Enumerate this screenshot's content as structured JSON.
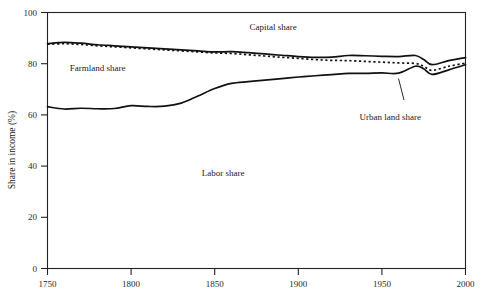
{
  "chart_data": {
    "type": "line",
    "title": "",
    "xlabel": "",
    "ylabel": "Share in income (%)",
    "xlim": [
      1750,
      2000
    ],
    "ylim": [
      0,
      100
    ],
    "xticks": [
      1750,
      1800,
      1850,
      1900,
      1950,
      2000
    ],
    "xtick_labels": [
      "1750",
      "1800",
      "1850",
      "1900",
      "1950",
      "2000"
    ],
    "yticks": [
      0,
      20,
      40,
      60,
      80,
      100
    ],
    "ytick_labels": [
      "0",
      "20",
      "40",
      "60",
      "80",
      "100"
    ],
    "grid": false,
    "legend_position": "none",
    "annotations": [
      {
        "text": "Capital share",
        "x": 1885,
        "y": 93,
        "region": "between upper solid line and top of plot"
      },
      {
        "text": "Farmland share",
        "x": 1780,
        "y": 77,
        "region": "band below upper solid line"
      },
      {
        "text": "Labor share",
        "x": 1855,
        "y": 36,
        "region": "large area below lower solid line"
      },
      {
        "text": "Urban land share",
        "x": 1955,
        "y": 58,
        "region": "leader line points to narrow band near 1963"
      }
    ],
    "series": [
      {
        "name": "Capital share boundary (total capital share upper envelope)",
        "style": "solid",
        "x": [
          1750,
          1760,
          1770,
          1780,
          1790,
          1800,
          1810,
          1820,
          1830,
          1840,
          1850,
          1860,
          1870,
          1880,
          1890,
          1900,
          1910,
          1920,
          1930,
          1940,
          1950,
          1960,
          1970,
          1975,
          1980,
          1990,
          2000
        ],
        "values": [
          87.8,
          88.3,
          88.0,
          87.4,
          87.0,
          86.6,
          86.2,
          85.8,
          85.4,
          85.0,
          84.6,
          84.7,
          84.3,
          83.8,
          83.3,
          82.8,
          82.5,
          82.6,
          83.2,
          83.1,
          82.9,
          82.8,
          83.2,
          81.6,
          79.6,
          81.2,
          82.4
        ]
      },
      {
        "name": "Farmland / urban land boundary",
        "style": "dotted",
        "x": [
          1750,
          1760,
          1770,
          1780,
          1790,
          1800,
          1810,
          1820,
          1830,
          1840,
          1850,
          1860,
          1870,
          1880,
          1890,
          1900,
          1910,
          1920,
          1930,
          1940,
          1950,
          1960,
          1970,
          1975,
          1980,
          1990,
          2000
        ],
        "values": [
          87.6,
          87.8,
          87.5,
          87.0,
          86.6,
          86.2,
          85.8,
          85.4,
          85.0,
          84.6,
          84.2,
          84.0,
          83.5,
          83.0,
          82.5,
          82.1,
          81.6,
          81.3,
          81.2,
          80.9,
          80.6,
          80.3,
          80.1,
          79.0,
          77.4,
          79.0,
          80.2
        ]
      },
      {
        "name": "Labor share boundary (urban land share lower envelope)",
        "style": "solid",
        "x": [
          1750,
          1760,
          1770,
          1780,
          1790,
          1800,
          1810,
          1820,
          1830,
          1840,
          1850,
          1860,
          1870,
          1880,
          1890,
          1900,
          1910,
          1920,
          1930,
          1940,
          1950,
          1960,
          1970,
          1975,
          1980,
          1990,
          2000
        ],
        "values": [
          63.2,
          62.3,
          62.6,
          62.4,
          62.5,
          63.6,
          63.3,
          63.4,
          64.6,
          67.4,
          70.3,
          72.3,
          73.0,
          73.6,
          74.2,
          74.8,
          75.3,
          75.7,
          76.2,
          76.2,
          76.4,
          76.3,
          79.0,
          78.0,
          75.8,
          77.6,
          79.6
        ]
      }
    ]
  }
}
